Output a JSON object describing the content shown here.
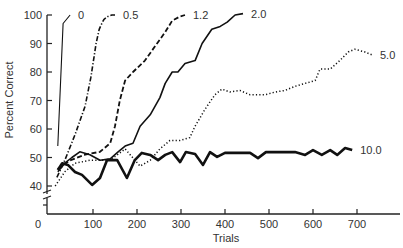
{
  "chart_data": {
    "type": "line",
    "title": "",
    "xlabel": "Trials",
    "ylabel": "Percent Correct",
    "xlim": [
      0,
      800
    ],
    "ylim": [
      40,
      100
    ],
    "x_ticks": [
      0,
      100,
      200,
      300,
      400,
      500,
      600,
      700
    ],
    "y_ticks": [
      40,
      50,
      60,
      70,
      80,
      90,
      100
    ],
    "grid": false,
    "legend": "inline labels at line ends",
    "axis_breaks": {
      "y": "break below 40",
      "x": "break near 0"
    },
    "series": [
      {
        "name": "0",
        "style": "thin-solid",
        "label_pos": [
          0,
          100
        ],
        "points": [
          [
            20,
            54
          ],
          [
            32,
            97
          ],
          [
            48,
            100
          ]
        ]
      },
      {
        "name": "0.5",
        "style": "dash-dot",
        "label_pos": [
          0.5,
          100
        ],
        "points": [
          [
            18,
            43
          ],
          [
            36,
            49
          ],
          [
            59,
            58
          ],
          [
            82,
            68
          ],
          [
            95,
            78
          ],
          [
            102,
            85
          ],
          [
            107,
            90
          ],
          [
            114,
            95
          ],
          [
            120,
            97
          ],
          [
            125,
            98.5
          ],
          [
            134,
            99.5
          ],
          [
            143,
            100
          ],
          [
            150,
            100
          ]
        ]
      },
      {
        "name": "1.2",
        "style": "dashed",
        "label_pos": [
          1.2,
          100
        ],
        "points": [
          [
            20,
            46
          ],
          [
            48,
            49
          ],
          [
            82,
            51
          ],
          [
            116,
            52
          ],
          [
            139,
            55
          ],
          [
            150,
            61
          ],
          [
            161,
            70
          ],
          [
            173,
            77
          ],
          [
            191,
            80
          ],
          [
            218,
            84
          ],
          [
            241,
            89
          ],
          [
            264,
            94
          ],
          [
            280,
            98
          ],
          [
            298,
            99.5
          ],
          [
            309,
            100
          ]
        ]
      },
      {
        "name": "2.0",
        "style": "solid",
        "label_pos": [
          2.0,
          100
        ],
        "points": [
          [
            20,
            45
          ],
          [
            36,
            48
          ],
          [
            52,
            50
          ],
          [
            70,
            52
          ],
          [
            93,
            51
          ],
          [
            116,
            49
          ],
          [
            139,
            49.5
          ],
          [
            157,
            52
          ],
          [
            173,
            54
          ],
          [
            191,
            55
          ],
          [
            207,
            61
          ],
          [
            230,
            65
          ],
          [
            252,
            71
          ],
          [
            264,
            76
          ],
          [
            280,
            80
          ],
          [
            293,
            80
          ],
          [
            309,
            83
          ],
          [
            332,
            84
          ],
          [
            348,
            90
          ],
          [
            370,
            95
          ],
          [
            389,
            96
          ],
          [
            405,
            97.5
          ],
          [
            423,
            100
          ],
          [
            441,
            100.5
          ]
        ]
      },
      {
        "name": "5.0",
        "style": "dotted",
        "label_pos": [
          5.0,
          86
        ],
        "points": [
          [
            14,
            40
          ],
          [
            36,
            45
          ],
          [
            59,
            48
          ],
          [
            93,
            49
          ],
          [
            139,
            49
          ],
          [
            173,
            53
          ],
          [
            207,
            47
          ],
          [
            230,
            49
          ],
          [
            252,
            53
          ],
          [
            275,
            56
          ],
          [
            298,
            56
          ],
          [
            320,
            57
          ],
          [
            332,
            61
          ],
          [
            355,
            67
          ],
          [
            377,
            72
          ],
          [
            393,
            74
          ],
          [
            411,
            73
          ],
          [
            434,
            73.5
          ],
          [
            457,
            72
          ],
          [
            491,
            72
          ],
          [
            514,
            73
          ],
          [
            536,
            73.5
          ],
          [
            559,
            75
          ],
          [
            582,
            76
          ],
          [
            605,
            77
          ],
          [
            616,
            81
          ],
          [
            639,
            81
          ],
          [
            661,
            84
          ],
          [
            680,
            87
          ],
          [
            695,
            88
          ],
          [
            718,
            87
          ],
          [
            734,
            86
          ]
        ]
      },
      {
        "name": "10.0",
        "style": "thick-solid",
        "label_pos": [
          10.0,
          53
        ],
        "points": [
          [
            20,
            45.6
          ],
          [
            30,
            48
          ],
          [
            43,
            47.4
          ],
          [
            59,
            44.9
          ],
          [
            75,
            43.9
          ],
          [
            98,
            40.4
          ],
          [
            116,
            42.8
          ],
          [
            132,
            49.1
          ],
          [
            155,
            49.1
          ],
          [
            177,
            42.8
          ],
          [
            195,
            49.1
          ],
          [
            211,
            51.6
          ],
          [
            230,
            50.9
          ],
          [
            248,
            49.1
          ],
          [
            264,
            50.9
          ],
          [
            280,
            51.9
          ],
          [
            298,
            48.4
          ],
          [
            311,
            51.9
          ],
          [
            332,
            51.2
          ],
          [
            350,
            47.4
          ],
          [
            366,
            51.9
          ],
          [
            382,
            50.2
          ],
          [
            400,
            51.6
          ],
          [
            457,
            51.6
          ],
          [
            475,
            49.8
          ],
          [
            493,
            51.9
          ],
          [
            525,
            51.9
          ],
          [
            559,
            51.9
          ],
          [
            582,
            50.9
          ],
          [
            600,
            52.6
          ],
          [
            620,
            50.9
          ],
          [
            639,
            52.6
          ],
          [
            655,
            50.9
          ],
          [
            673,
            53.3
          ],
          [
            689,
            52.6
          ]
        ]
      }
    ]
  }
}
